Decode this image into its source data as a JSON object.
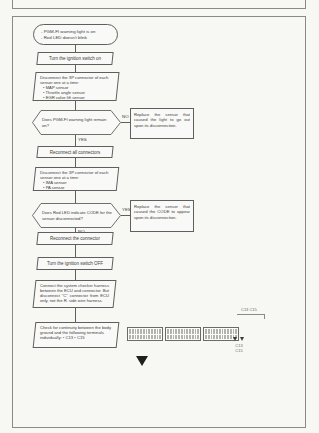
{
  "header": {
    "title_fragment": "1985-86 STANDARD"
  },
  "flowchart": {
    "start": {
      "line1": "- PGM-FI warning light is on",
      "line2": "- Red LED doesn't blink"
    },
    "step_ignition_on": {
      "label": "Turn the ignition switch on"
    },
    "step_disconnect_1": {
      "head": "Disconnect the 3P connector of each sensor one at a time:",
      "bullets": [
        "• MAP sensor",
        "• Throttle angle sensor",
        "• EGR valve lift sensor"
      ]
    },
    "decision_warning_light": {
      "question": "Does PGM-FI warning light remain on?",
      "no_label": "NO",
      "yes_label": "YES"
    },
    "result_replace_light": {
      "text": "Replace the sensor that caused the light to go out upon its disconnection."
    },
    "step_reconnect_all": {
      "label": "Reconnect all connectors"
    },
    "step_disconnect_2": {
      "head": "Disconnect the 3P connector of each sensor one at a time:",
      "bullets": [
        "• IMA sensor",
        "• PA sensor"
      ]
    },
    "decision_red_led": {
      "question": "Does Red LED indicate CODE for the sensor disconnected?",
      "yes_label": "YES",
      "no_label": "NO"
    },
    "result_replace_code": {
      "text": "Replace the sensor that caused the CODE to appear upon its disconnection."
    },
    "step_reconnect_connector": {
      "label": "Reconnect the connector"
    },
    "step_ignition_off": {
      "label": "Turn the ignition switch OFF"
    },
    "step_checker_harness": {
      "text": "Connect the system checker harness between the ECU and connector. But disconnect \"C\" connector from ECU only, not the R. side wire harness."
    },
    "step_continuity": {
      "head": "Check for continuity between the body ground and the following terminals individually:",
      "bullets": [
        "• C13",
        "• C15"
      ]
    }
  },
  "connector_diagram": {
    "label": "C13 C15",
    "marker_caption": [
      "C13",
      "C15"
    ],
    "blocks": 3,
    "rows": 2,
    "cols": 12
  },
  "colors": {
    "line": "#5f5f5d",
    "ink": "#3c3c3c",
    "arrow": "#1f1f1d",
    "paper": "#f7f7f4"
  }
}
